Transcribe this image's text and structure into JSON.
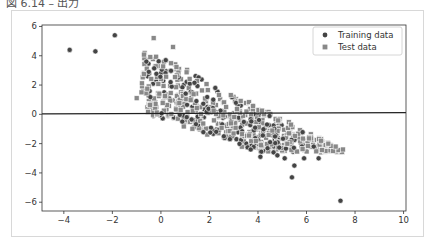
{
  "caption": "図 6.14 – 出力",
  "chart_data": {
    "type": "scatter",
    "title": "",
    "xlabel": "",
    "ylabel": "",
    "xlim": [
      -4.9,
      10.1
    ],
    "ylim": [
      -6.6,
      6.1
    ],
    "xticks": [
      -4,
      -2,
      0,
      2,
      4,
      6,
      8,
      10
    ],
    "yticks": [
      -6,
      -4,
      -2,
      0,
      2,
      4,
      6
    ],
    "grid": false,
    "legend_position": "upper right",
    "colors": {
      "training": "#444444",
      "test": "#888888",
      "line": "#222222"
    },
    "reference_line": {
      "x": [
        -4.9,
        10.1
      ],
      "y": [
        0.03,
        0.12
      ],
      "label": ""
    },
    "series": [
      {
        "name": "Training data",
        "marker": "circle",
        "outliers": [
          [
            -3.76,
            4.4
          ],
          [
            -2.7,
            4.3
          ],
          [
            -1.9,
            5.4
          ],
          [
            -0.6,
            3.6
          ],
          [
            -0.5,
            2.9
          ],
          [
            0.2,
            3.7
          ],
          [
            0.4,
            2.2
          ],
          [
            4.5,
            -1.9
          ],
          [
            3.7,
            -2.4
          ],
          [
            4.1,
            -2.9
          ],
          [
            4.8,
            -2.8
          ],
          [
            5.1,
            -3.0
          ],
          [
            5.5,
            -3.5
          ],
          [
            5.9,
            -3.0
          ],
          [
            5.4,
            -4.3
          ],
          [
            6.3,
            -2.2
          ],
          [
            6.5,
            -3.0
          ],
          [
            7.4,
            -5.9
          ]
        ],
        "band": {
          "count": 220,
          "x_range": [
            -0.6,
            6.0
          ],
          "upper_slope": -0.86,
          "upper_intercept": 3.9,
          "lower_slope": -0.55,
          "lower_intercept": -0.3
        }
      },
      {
        "name": "Test data",
        "marker": "square",
        "outliers": [
          [
            -0.3,
            5.2
          ],
          [
            0.5,
            4.6
          ],
          [
            -0.8,
            1.5
          ],
          [
            -1.0,
            1.1
          ],
          [
            7.5,
            -2.4
          ],
          [
            7.2,
            -2.2
          ],
          [
            6.9,
            -2.0
          ],
          [
            6.6,
            -1.8
          ]
        ],
        "band": {
          "count": 420,
          "x_range": [
            -0.8,
            7.5
          ],
          "upper_slope": -0.86,
          "upper_intercept": 4.0,
          "lower_slope": -0.55,
          "lower_intercept": -0.4
        }
      }
    ],
    "legend": [
      "Training data",
      "Test data"
    ]
  }
}
